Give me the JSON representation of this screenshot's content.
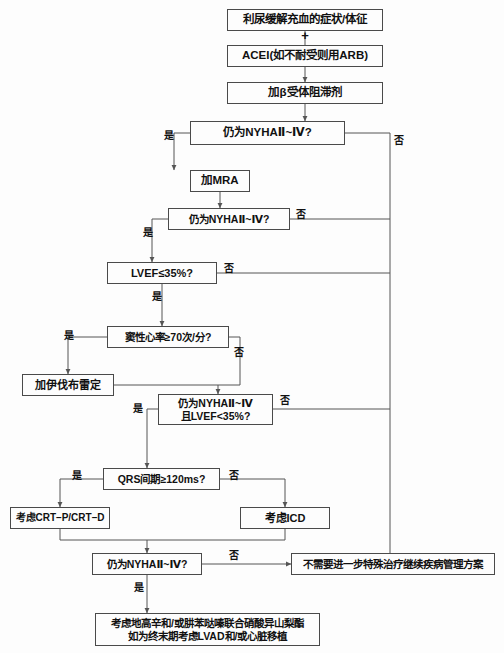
{
  "diagram": {
    "canvas": {
      "width": 504,
      "height": 653
    },
    "colors": {
      "background": "#fdfdfd",
      "box_border": "#4a4a4a",
      "box_fill": "#fdfdfd",
      "line": "#555555",
      "text": "#111111"
    },
    "plus_connector": {
      "symbol": "+",
      "x": 305,
      "y": 35,
      "font_size": 13
    },
    "nodes": [
      {
        "id": "diuretic",
        "kind": "process",
        "text": "利尿缓解充血的症状/体征",
        "x": 227,
        "y": 9,
        "w": 156,
        "h": 22,
        "font_size": 11.5
      },
      {
        "id": "acei",
        "kind": "process",
        "text": "ACEI(如不耐受则用ARB)",
        "x": 227,
        "y": 45,
        "w": 156,
        "h": 22,
        "font_size": 11.5
      },
      {
        "id": "beta-blocker",
        "kind": "process",
        "text": "加β受体阻滞剂",
        "x": 227,
        "y": 82,
        "w": 156,
        "h": 22,
        "font_size": 11.5
      },
      {
        "id": "nyha-1",
        "kind": "decision",
        "text": "仍为NYHAⅡ~Ⅳ?",
        "x": 190,
        "y": 121,
        "w": 155,
        "h": 24,
        "font_size": 11.5
      },
      {
        "id": "mra",
        "kind": "process",
        "text": "加MRA",
        "x": 190,
        "y": 170,
        "w": 60,
        "h": 22,
        "font_size": 11.5
      },
      {
        "id": "nyha-2",
        "kind": "decision",
        "text": "仍为NYHAⅡ~Ⅳ?",
        "x": 168,
        "y": 208,
        "w": 122,
        "h": 22,
        "font_size": 10.5
      },
      {
        "id": "lvef",
        "kind": "decision",
        "text": "LVEF≤35%?",
        "x": 107,
        "y": 262,
        "w": 110,
        "h": 22,
        "font_size": 11
      },
      {
        "id": "heart-rate",
        "kind": "decision",
        "text": "窦性心率≥70次/分?",
        "x": 107,
        "y": 326,
        "w": 122,
        "h": 22,
        "font_size": 10.5
      },
      {
        "id": "ivabradine",
        "kind": "process",
        "text": "加伊伐布雷定",
        "x": 22,
        "y": 374,
        "w": 92,
        "h": 22,
        "font_size": 11
      },
      {
        "id": "nyha-lvef",
        "kind": "decision",
        "text": "仍为NYHAⅡ~Ⅳ\n且LVEF<35%?",
        "x": 158,
        "y": 394,
        "w": 115,
        "h": 31,
        "font_size": 10.5,
        "two_line": true
      },
      {
        "id": "qrs",
        "kind": "decision",
        "text": "QRS间期≥120ms?",
        "x": 103,
        "y": 468,
        "w": 117,
        "h": 22,
        "font_size": 10.5
      },
      {
        "id": "crt",
        "kind": "process",
        "text": "考虑CRT–P/CRT–D",
        "x": 10,
        "y": 507,
        "w": 100,
        "h": 22,
        "font_size": 10
      },
      {
        "id": "icd",
        "kind": "process",
        "text": "考虑ICD",
        "x": 240,
        "y": 507,
        "w": 90,
        "h": 22,
        "font_size": 11
      },
      {
        "id": "nyha-3",
        "kind": "decision",
        "text": "仍为NYHAⅡ~Ⅳ?",
        "x": 92,
        "y": 553,
        "w": 110,
        "h": 22,
        "font_size": 10.5
      },
      {
        "id": "no-further",
        "kind": "terminal",
        "text": "不需要进一步特殊治疗继续疾病管理方案",
        "x": 291,
        "y": 553,
        "w": 204,
        "h": 22,
        "font_size": 10.5
      },
      {
        "id": "advanced",
        "kind": "terminal",
        "text": "考虑地高辛和/或肼苯哒嗪联合硝酸异山梨酯\n如为终末期考虑LVAD和/或心脏移植",
        "x": 95,
        "y": 613,
        "w": 225,
        "h": 33,
        "font_size": 10.5,
        "two_line": true
      }
    ],
    "edge_labels": [
      {
        "id": "yes-1",
        "text": "是",
        "x": 164,
        "y": 131,
        "font_size": 10
      },
      {
        "id": "no-1",
        "text": "否",
        "x": 394,
        "y": 136,
        "font_size": 10
      },
      {
        "id": "yes-2",
        "text": "是",
        "x": 143,
        "y": 228,
        "font_size": 10
      },
      {
        "id": "no-2",
        "text": "否",
        "x": 296,
        "y": 210,
        "font_size": 10
      },
      {
        "id": "yes-3",
        "text": "是",
        "x": 152,
        "y": 292,
        "font_size": 10
      },
      {
        "id": "no-3",
        "text": "否",
        "x": 224,
        "y": 264,
        "font_size": 10
      },
      {
        "id": "yes-4",
        "text": "是",
        "x": 64,
        "y": 331,
        "font_size": 10
      },
      {
        "id": "no-4",
        "text": "否",
        "x": 234,
        "y": 348,
        "font_size": 10
      },
      {
        "id": "yes-5",
        "text": "是",
        "x": 133,
        "y": 404,
        "font_size": 10
      },
      {
        "id": "no-5",
        "text": "否",
        "x": 280,
        "y": 396,
        "font_size": 10
      },
      {
        "id": "yes-6",
        "text": "是",
        "x": 72,
        "y": 471,
        "font_size": 10
      },
      {
        "id": "no-6",
        "text": "否",
        "x": 229,
        "y": 471,
        "font_size": 10
      },
      {
        "id": "yes-7",
        "text": "是",
        "x": 134,
        "y": 583,
        "font_size": 10
      },
      {
        "id": "no-7",
        "text": "否",
        "x": 229,
        "y": 551,
        "font_size": 10
      }
    ],
    "connectors": [
      {
        "id": "c-diuretic-acei",
        "points": "305,31 305,45",
        "arrow": false
      },
      {
        "id": "c-acei-beta",
        "points": "305,67 305,82",
        "arrow": true
      },
      {
        "id": "c-beta-nyha1",
        "points": "305,104 305,121",
        "arrow": true
      },
      {
        "id": "c-nyha1-yes",
        "points": "190,133 174,133 174,170",
        "arrow": true
      },
      {
        "id": "c-nyha1-no",
        "points": "345,133 390,133 390,560",
        "arrow": true
      },
      {
        "id": "c-mra-nyha2",
        "points": "220,192 220,208",
        "arrow": true
      },
      {
        "id": "c-nyha2-yes",
        "points": "168,219 152,219 152,262",
        "arrow": true
      },
      {
        "id": "c-nyha2-no",
        "points": "290,219 390,219",
        "arrow": false
      },
      {
        "id": "c-lvef-yes",
        "points": "162,284 162,326",
        "arrow": true
      },
      {
        "id": "c-lvef-no",
        "points": "217,273 390,273",
        "arrow": false
      },
      {
        "id": "c-hr-yes",
        "points": "107,337 68,337 68,374",
        "arrow": true
      },
      {
        "id": "c-hr-no",
        "points": "229,337 240,337 240,385 218,385",
        "arrow": false
      },
      {
        "id": "c-ivabradine-merge",
        "points": "114,385 218,385",
        "arrow": false
      },
      {
        "id": "c-merge-nyhalvef",
        "points": "218,385 218,394",
        "arrow": true
      },
      {
        "id": "c-nyhalvef-yes",
        "points": "158,409 147,409 147,468",
        "arrow": true
      },
      {
        "id": "c-nyhalvef-no",
        "points": "273,409 390,409",
        "arrow": false
      },
      {
        "id": "c-qrs-yes",
        "points": "103,479 60,479 60,507",
        "arrow": true
      },
      {
        "id": "c-qrs-no",
        "points": "220,479 285,479 285,507",
        "arrow": true
      },
      {
        "id": "c-crt-down",
        "points": "60,529 60,540 147,540",
        "arrow": false
      },
      {
        "id": "c-icd-down",
        "points": "285,529 285,540 147,540",
        "arrow": false
      },
      {
        "id": "c-merge-nyha3",
        "points": "147,540 147,553",
        "arrow": true
      },
      {
        "id": "c-nyha3-no",
        "points": "202,564 291,564",
        "arrow": true
      },
      {
        "id": "c-nyha3-yes",
        "points": "147,575 147,613",
        "arrow": true
      }
    ]
  }
}
